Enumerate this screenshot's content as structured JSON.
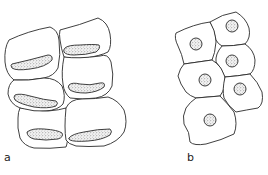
{
  "figure": {
    "panels": [
      {
        "id": "a",
        "label": "a",
        "description": "Columnar/cuboidal cells stacked in two columns, each with an elongated, crescent-shaped stippled nucleus near the base",
        "cell_count": 6,
        "nucleus_shape": "elongated-crescent"
      },
      {
        "id": "b",
        "label": "b",
        "description": "Polygonal cells in an irregular sheet, each with a central round stippled nucleus",
        "cell_count": 6,
        "nucleus_shape": "round"
      }
    ],
    "colors": {
      "line": "#2a2a2a",
      "background": "#ffffff",
      "stipple": "#555555"
    }
  }
}
